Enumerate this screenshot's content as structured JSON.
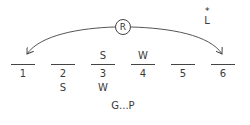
{
  "diagram": {
    "type": "slot-ordering-puzzle",
    "circular_marker": "R",
    "floating_label": {
      "marker": "*",
      "letter": "L"
    },
    "slots": [
      {
        "number": "1",
        "above": "",
        "below": ""
      },
      {
        "number": "2",
        "above": "",
        "below": "S"
      },
      {
        "number": "3",
        "above": "S",
        "below": "W"
      },
      {
        "number": "4",
        "above": "W",
        "below": ""
      },
      {
        "number": "5",
        "above": "",
        "below": ""
      },
      {
        "number": "6",
        "above": "",
        "below": ""
      }
    ],
    "arrows": [
      {
        "from": "R",
        "to": "1"
      },
      {
        "from": "R",
        "to": "6"
      }
    ],
    "constraint_note": "G...P",
    "colors": {
      "ink": "#333333",
      "background": "#ffffff"
    }
  }
}
